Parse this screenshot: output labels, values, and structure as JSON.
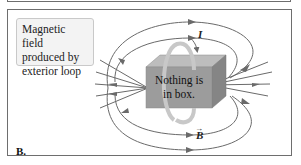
{
  "figure": {
    "panel_label": "B.",
    "caption_lines": [
      "Magnetic field",
      "produced by",
      "exterior loop"
    ],
    "box_text_lines": [
      "Nothing is",
      "in box."
    ],
    "current_symbol": "I",
    "field_symbol": "B",
    "field_vector_arrow": "→",
    "colors": {
      "field_lines": "#6a6a6a",
      "box_front": "#9c9c9c",
      "box_top": "#bdbdbd",
      "box_side": "#858585",
      "loop": "#b8b8b8",
      "caption_bg": "#f3f3f3",
      "frame": "#6e6e6e"
    }
  }
}
